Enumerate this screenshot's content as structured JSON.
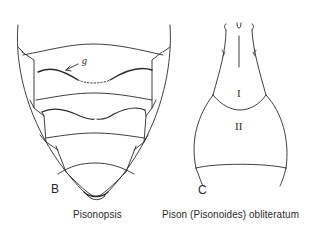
{
  "figure": {
    "panels": [
      {
        "id": "B",
        "letter": "B",
        "caption": "Pisonopsis",
        "annotations": [
          {
            "label": "g"
          }
        ]
      },
      {
        "id": "C",
        "letter": "C",
        "caption": "Pison (Pisonoides) obliteratum",
        "segment_labels": [
          "I",
          "II"
        ]
      }
    ],
    "line_color": "#2a2a2a",
    "background": "#ffffff"
  }
}
